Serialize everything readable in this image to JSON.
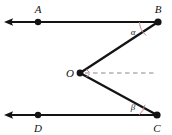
{
  "figure": {
    "background_color": "#ffffff",
    "stroke_color": "#141414",
    "accent_color": "#c87f86",
    "dash_color": "#8a8a8a",
    "width": 172,
    "height": 135
  },
  "points": {
    "A": {
      "label": "A",
      "x": 38,
      "y": 22,
      "label_x": 38,
      "label_y": 11,
      "dot": true
    },
    "B": {
      "label": "B",
      "x": 158,
      "y": 22,
      "label_x": 158,
      "label_y": 11,
      "dot": true
    },
    "O": {
      "label": "O",
      "x": 80,
      "y": 73,
      "label_x": 70,
      "label_y": 74,
      "dot": true
    },
    "C": {
      "label": "C",
      "x": 157,
      "y": 115,
      "label_x": 157,
      "label_y": 130,
      "dot": true
    },
    "D": {
      "label": "D",
      "x": 38,
      "y": 115,
      "label_x": 38,
      "label_y": 130,
      "dot": true
    }
  },
  "angles": {
    "alpha": {
      "label": "α",
      "vertex": "B",
      "label_x": 133,
      "label_y": 34
    },
    "beta": {
      "label": "β",
      "vertex": "C",
      "label_x": 133,
      "label_y": 110
    }
  },
  "rays": {
    "top": {
      "name": "ray-AB",
      "from_x": 158,
      "from_y": 22,
      "to_x": 5,
      "to_y": 22,
      "arrow_at": "left"
    },
    "bottom": {
      "name": "ray-DC",
      "from_x": 157,
      "from_y": 115,
      "to_x": 5,
      "to_y": 115,
      "arrow_at": "left"
    }
  },
  "segments": {
    "OB": {
      "name": "segment-OB",
      "x1": 80,
      "y1": 73,
      "x2": 158,
      "y2": 22
    },
    "OC": {
      "name": "segment-OC",
      "x1": 80,
      "y1": 73,
      "x2": 157,
      "y2": 115
    }
  },
  "dashed": {
    "name": "dashed-ray-from-O",
    "x1": 84,
    "y1": 73,
    "x2": 156,
    "y2": 73
  }
}
